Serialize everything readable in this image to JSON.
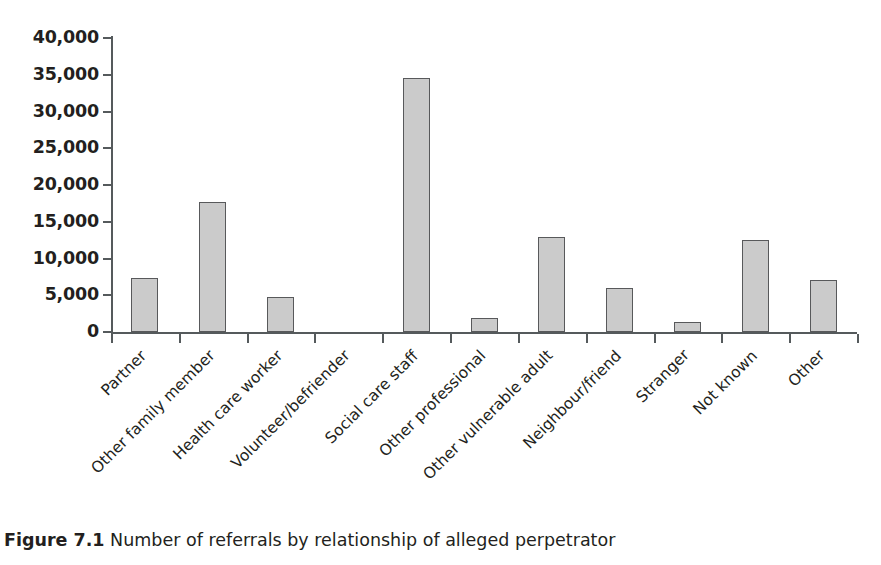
{
  "chart_data": {
    "type": "bar",
    "title": "",
    "xlabel": "",
    "ylabel": "",
    "ylim": [
      0,
      40000
    ],
    "grid": false,
    "legend": null,
    "categories": [
      "Partner",
      "Other family member",
      "Health care worker",
      "Volunteer/befriender",
      "Social care staff",
      "Other professional",
      "Other vulnerable adult",
      "Neighbour/friend",
      "Stranger",
      "Not known",
      "Other"
    ],
    "values": [
      7350,
      17700,
      4800,
      0,
      34550,
      1900,
      12900,
      6050,
      1300,
      12550,
      7050
    ],
    "ytick_labels": [
      "0",
      "5,000",
      "10,000",
      "15,000",
      "20,000",
      "25,000",
      "30,000",
      "35,000",
      "40,000"
    ],
    "ytick_values": [
      0,
      5000,
      10000,
      15000,
      20000,
      25000,
      30000,
      35000,
      40000
    ],
    "bar_fill": "#cbcbcb",
    "bar_border": "#58595b",
    "axis_color": "#555a5c"
  },
  "caption": {
    "number": "Figure 7.1",
    "text": "Number of referrals by relationship of alleged perpetrator"
  }
}
